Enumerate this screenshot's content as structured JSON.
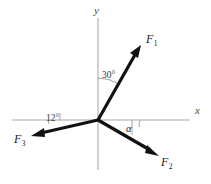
{
  "figure": {
    "type": "force-vector-diagram",
    "background_color": "#ffffff",
    "axis_color": "#a9a9a9",
    "vector_color": "#111111"
  },
  "axes": {
    "x_label": "x",
    "y_label": "y",
    "origin": {
      "x": 98,
      "y": 120
    },
    "x_axis": {
      "x1": 12,
      "y1": 120,
      "x2": 190,
      "y2": 120
    },
    "y_axis": {
      "x1": 98,
      "y1": 18,
      "x2": 98,
      "y2": 170
    }
  },
  "vectors": [
    {
      "name": "F1",
      "label": "F",
      "subscript": "1",
      "tip": {
        "x": 141,
        "y": 46
      },
      "label_pos": {
        "x": 146,
        "y": 33
      }
    },
    {
      "name": "F2",
      "label": "F",
      "subscript": "2",
      "tip": {
        "x": 158,
        "y": 156
      },
      "label_pos": {
        "x": 161,
        "y": 156
      }
    },
    {
      "name": "F3",
      "label": "F",
      "subscript": "3",
      "tip": {
        "x": 32,
        "y": 136
      },
      "label_pos": {
        "x": 14,
        "y": 133
      }
    }
  ],
  "angles": [
    {
      "name": "angle-30",
      "text": "30°",
      "between": "y-axis and F1",
      "label_pos": {
        "x": 102,
        "y": 71
      }
    },
    {
      "name": "angle-12",
      "text": "12°",
      "between": "negative x-axis and F3",
      "label_pos": {
        "x": 46,
        "y": 114
      }
    },
    {
      "name": "angle-alpha",
      "text": "α",
      "between": "positive x-axis and F2",
      "label_pos": {
        "x": 126,
        "y": 124
      }
    }
  ]
}
